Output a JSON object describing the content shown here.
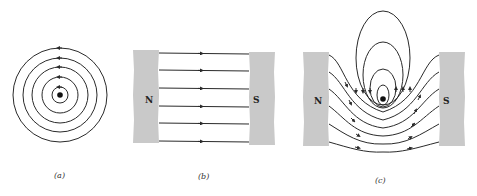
{
  "figure": {
    "panels": [
      {
        "id": "a",
        "caption": "(a)",
        "description": "Magnetic field lines of a straight current-carrying wire (out of page): concentric circles"
      },
      {
        "id": "b",
        "caption": "(b)",
        "description": "Uniform magnetic field between N and S poles",
        "poles": {
          "north": "N",
          "south": "S"
        }
      },
      {
        "id": "c",
        "caption": "(c)",
        "description": "Superposition of wire field and uniform field between poles",
        "poles": {
          "north": "N",
          "south": "S"
        }
      }
    ]
  }
}
